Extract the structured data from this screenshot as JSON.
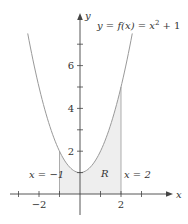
{
  "chart_data": {
    "type": "area",
    "title": "",
    "function_label": {
      "prefix": "y = f(x) = x",
      "exponent": "2",
      "suffix": " + 1"
    },
    "xlabel": "x",
    "ylabel": "y",
    "xlim": [
      -3.4,
      4.5
    ],
    "ylim": [
      -1,
      8.5
    ],
    "x_ticks": [
      -3,
      -2,
      -1,
      0,
      1,
      2,
      3
    ],
    "x_tick_labels": [
      {
        "value": -2,
        "label": "−2"
      },
      {
        "value": 2,
        "label": "2"
      }
    ],
    "y_ticks": [
      1,
      2,
      3,
      4,
      5,
      6,
      7
    ],
    "y_tick_labels": [
      {
        "value": 2,
        "label": "2"
      },
      {
        "value": 4,
        "label": "4"
      },
      {
        "value": 6,
        "label": "6"
      }
    ],
    "curve": {
      "expression": "x^2 + 1",
      "x_range": [
        -2.55,
        2.55
      ],
      "x": [
        -2.5,
        -2,
        -1.5,
        -1,
        -0.5,
        0,
        0.5,
        1,
        1.5,
        2,
        2.5
      ],
      "y": [
        7.25,
        5,
        3.25,
        2,
        1.25,
        1,
        1.25,
        2,
        3.25,
        5,
        7.25
      ]
    },
    "region": {
      "label": "R",
      "x_from": -1,
      "x_to": 2,
      "fill": "#eeeeee"
    },
    "boundaries": [
      {
        "label": "x = −1",
        "x": -1
      },
      {
        "label": "x = 2",
        "x": 2
      }
    ],
    "grid": false,
    "legend": "none"
  },
  "colors": {
    "axis": "#444444",
    "curve": "#999999",
    "region_fill": "#eeeeee",
    "boundary_line": "#999999",
    "text": "#333333"
  }
}
